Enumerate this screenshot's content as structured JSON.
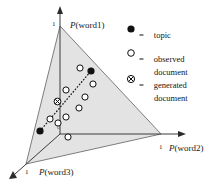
{
  "figure": {
    "type": "diagram"
  },
  "axes": {
    "word1": {
      "label": "P(word1)",
      "tick": "1"
    },
    "word2": {
      "label": "P(word2)",
      "tick": "1"
    },
    "word3": {
      "label": "P(word3)",
      "tick": "1"
    },
    "origin": "0"
  },
  "legend": {
    "equals": "=",
    "items": [
      {
        "marker": "filled-circle-icon",
        "line1": "topic",
        "line2": ""
      },
      {
        "marker": "open-circle-icon",
        "line1": "observed",
        "line2": "document"
      },
      {
        "marker": "crossed-circle-icon",
        "line1": "generated",
        "line2": "document"
      }
    ]
  },
  "chart_data": {
    "type": "scatter",
    "title": "",
    "xlabel": "P(word2)",
    "ylabel": "P(word1)",
    "simplex_vertices": [
      {
        "name": "P(word1)=1",
        "x": 60,
        "y": 26
      },
      {
        "name": "P(word2)=1",
        "x": 161,
        "y": 134
      },
      {
        "name": "P(word3)=1",
        "x": 26,
        "y": 164
      }
    ],
    "series": [
      {
        "name": "topic",
        "marker": "filled-circle",
        "points": [
          {
            "x": 91,
            "y": 71
          },
          {
            "x": 40,
            "y": 131
          }
        ]
      },
      {
        "name": "generated document",
        "marker": "crossed-circle",
        "points": [
          {
            "x": 57.5,
            "y": 101.5
          }
        ]
      },
      {
        "name": "observed document",
        "marker": "open-circle",
        "points": [
          {
            "x": 80,
            "y": 68
          },
          {
            "x": 93,
            "y": 84
          },
          {
            "x": 66,
            "y": 90
          },
          {
            "x": 85,
            "y": 97
          },
          {
            "x": 79,
            "y": 108
          },
          {
            "x": 66,
            "y": 117
          },
          {
            "x": 50,
            "y": 119
          },
          {
            "x": 58,
            "y": 123
          },
          {
            "x": 68,
            "y": 137
          }
        ]
      }
    ],
    "trend_line": {
      "style": "dotted",
      "from": {
        "x": 40,
        "y": 131
      },
      "to": {
        "x": 91,
        "y": 71
      }
    },
    "grid": false,
    "legend_position": "top-right"
  },
  "colors": {
    "simplex_fill": "#e3e3e3",
    "simplex_stroke": "#6b6b6b",
    "axis_stroke": "#3c3c3c",
    "marker_fill": "#111111",
    "marker_stroke": "#111111",
    "background": "#ffffff"
  }
}
